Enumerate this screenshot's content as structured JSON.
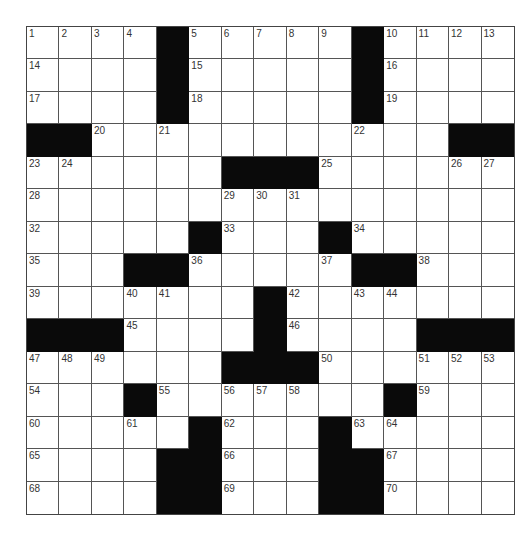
{
  "puzzle": {
    "rows": 15,
    "cols": 15,
    "colors": {
      "block": "#0a0a0a",
      "cell": "#ffffff",
      "gridline": "#555555"
    },
    "grid": [
      [
        "1",
        "2",
        "3",
        "4",
        "#",
        "5",
        "6",
        "7",
        "8",
        "9",
        "#",
        "10",
        "11",
        "12",
        "13"
      ],
      [
        "14",
        ".",
        ".",
        ".",
        "#",
        "15",
        ".",
        ".",
        ".",
        ".",
        "#",
        "16",
        ".",
        ".",
        "."
      ],
      [
        "17",
        ".",
        ".",
        ".",
        "#",
        "18",
        ".",
        ".",
        ".",
        ".",
        "#",
        "19",
        ".",
        ".",
        "."
      ],
      [
        "#",
        "#",
        "20",
        ".",
        "21",
        ".",
        ".",
        ".",
        ".",
        ".",
        "22",
        ".",
        ".",
        "#",
        "#"
      ],
      [
        "23",
        "24",
        ".",
        ".",
        ".",
        ".",
        "#",
        "#",
        "#",
        "25",
        ".",
        ".",
        ".",
        "26",
        "27"
      ],
      [
        "28",
        ".",
        ".",
        ".",
        ".",
        ".",
        "29",
        "30",
        "31",
        ".",
        ".",
        ".",
        ".",
        ".",
        "."
      ],
      [
        "32",
        ".",
        ".",
        ".",
        ".",
        "#",
        "33",
        ".",
        ".",
        "#",
        "34",
        ".",
        ".",
        ".",
        "."
      ],
      [
        "35",
        ".",
        ".",
        "#",
        "#",
        "36",
        ".",
        ".",
        ".",
        "37",
        "#",
        "#",
        "38",
        ".",
        "."
      ],
      [
        "39",
        ".",
        ".",
        "40",
        "41",
        ".",
        ".",
        "#",
        "42",
        ".",
        "43",
        "44",
        ".",
        ".",
        "."
      ],
      [
        "#",
        "#",
        "#",
        "45",
        ".",
        ".",
        ".",
        "#",
        "46",
        ".",
        ".",
        ".",
        "#",
        "#",
        "#"
      ],
      [
        "47",
        "48",
        "49",
        ".",
        ".",
        ".",
        "#",
        "#",
        "#",
        "50",
        ".",
        ".",
        "51",
        "52",
        "53"
      ],
      [
        "54",
        ".",
        ".",
        "#",
        "55",
        ".",
        "56",
        "57",
        "58",
        ".",
        ".",
        "#",
        "59",
        ".",
        "."
      ],
      [
        "60",
        ".",
        ".",
        "61",
        ".",
        "#",
        "62",
        ".",
        ".",
        "#",
        "63",
        "64",
        ".",
        ".",
        "."
      ],
      [
        "65",
        ".",
        ".",
        ".",
        "#",
        "#",
        "66",
        ".",
        ".",
        "#",
        "#",
        "67",
        ".",
        ".",
        "."
      ],
      [
        "68",
        ".",
        ".",
        ".",
        "#",
        "#",
        "69",
        ".",
        ".",
        "#",
        "#",
        "70",
        ".",
        ".",
        "."
      ]
    ],
    "entries": {}
  }
}
